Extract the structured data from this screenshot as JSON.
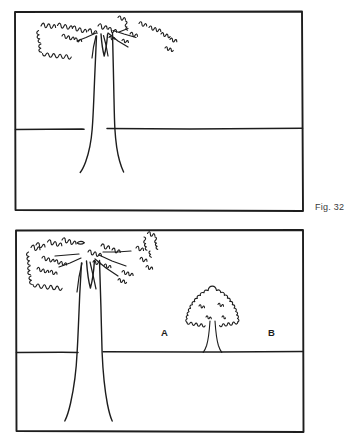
{
  "page": {
    "background_color": "#ffffff",
    "ink_color": "#1d1d1d",
    "caption_color": "#3a3a3a",
    "style": "black-and-white line drawing / pen sketch illustration"
  },
  "figures": [
    {
      "id": "figure-32",
      "caption": "Fig. 32",
      "description": "Line drawing of a single large deciduous tree with a broad scalloped canopy, a thick flaring trunk and a horizon line across the scene.",
      "frame": {
        "x": 14,
        "y": 11,
        "width": 289,
        "height": 200
      },
      "horizon_y": 129,
      "markers": [],
      "trees": [
        {
          "name": "large-tree",
          "kind": "large-deciduous-tree",
          "canopy_center_x": 100,
          "canopy_top_y": 16,
          "trunk_base_x": 104,
          "trunk_base_y": 172
        }
      ]
    },
    {
      "id": "figure-33",
      "caption": "Fig. 33",
      "description": "Line drawing showing a large deciduous tree at the left and a small young tree at the right of centre, with ground-level marker letters A and B and a horizon line across the scene.",
      "frame": {
        "x": 15,
        "y": 230,
        "width": 288,
        "height": 202
      },
      "horizon_y": 352,
      "markers": [
        {
          "label": "A",
          "x": 161,
          "y": 336
        },
        {
          "label": "B",
          "x": 268,
          "y": 336
        }
      ],
      "trees": [
        {
          "name": "large-tree",
          "kind": "large-deciduous-tree",
          "canopy_center_x": 96,
          "canopy_top_y": 238,
          "trunk_base_x": 99,
          "trunk_base_y": 421
        },
        {
          "name": "small-tree",
          "kind": "small-young-tree",
          "canopy_center_x": 212,
          "canopy_top_y": 290,
          "trunk_base_x": 212,
          "trunk_base_y": 353
        }
      ]
    }
  ]
}
